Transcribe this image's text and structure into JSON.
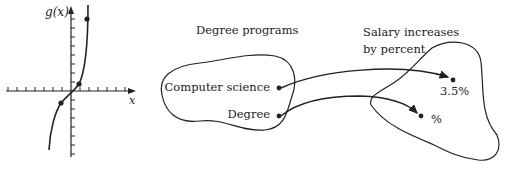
{
  "graph": {
    "y_axis_label": "g(x)",
    "x_axis_label": "x",
    "points": [
      {
        "x": 87,
        "y": 19
      },
      {
        "x": 79,
        "y": 84
      },
      {
        "x": 61,
        "y": 103
      }
    ]
  },
  "mapping": {
    "domain_title": "Degree programs",
    "domain_items": [
      "Computer science",
      "Degree"
    ],
    "codomain_title_line1": "Salary increases",
    "codomain_title_line2": "by percent",
    "codomain_items": [
      "3.5%",
      "%"
    ]
  },
  "colors": {
    "ink": "#222222",
    "background": "#ffffff"
  }
}
